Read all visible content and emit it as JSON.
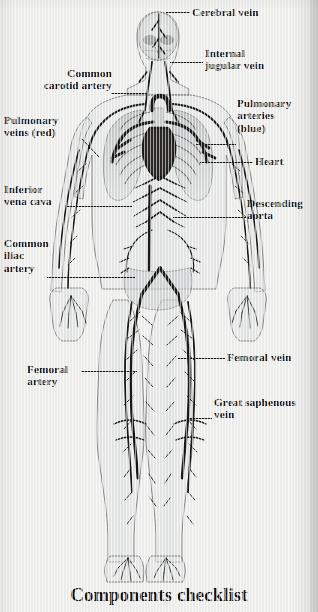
{
  "figure": {
    "caption": "Components checklist",
    "background_color": "#f1f1f0",
    "ink_color": "#1b1a18",
    "body_tint": "#b9bcbd"
  },
  "labels": [
    {
      "id": "cerebral-vein",
      "text": "Cerebral vein",
      "side": "right",
      "align": "left",
      "x": 192,
      "y": 6,
      "width": 120
    },
    {
      "id": "internal-jugular",
      "text": "Internal\njugular vein",
      "side": "right",
      "align": "left",
      "x": 205,
      "y": 47,
      "width": 110
    },
    {
      "id": "common-carotid",
      "text": "Common\ncarotid artery",
      "side": "left",
      "align": "right",
      "x": 8,
      "y": 67,
      "width": 104
    },
    {
      "id": "pulmonary-arteries",
      "text": "Pulmonary\narteries\n(blue)",
      "side": "right",
      "align": "left",
      "x": 237,
      "y": 97,
      "width": 80
    },
    {
      "id": "pulmonary-veins",
      "text": "Pulmonary\nveins (red)",
      "side": "left",
      "align": "left",
      "x": 4,
      "y": 114,
      "width": 100
    },
    {
      "id": "heart",
      "text": "Heart",
      "side": "right",
      "align": "left",
      "x": 255,
      "y": 155,
      "width": 60
    },
    {
      "id": "inferior-vena-cava",
      "text": "Inferior\nvena cava",
      "side": "left",
      "align": "left",
      "x": 4,
      "y": 183,
      "width": 96
    },
    {
      "id": "descending-aorta",
      "text": "Descending\naorta",
      "side": "right",
      "align": "left",
      "x": 247,
      "y": 197,
      "width": 70
    },
    {
      "id": "common-iliac",
      "text": "Common\niliac\nartery",
      "side": "left",
      "align": "left",
      "x": 4,
      "y": 237,
      "width": 80
    },
    {
      "id": "femoral-vein",
      "text": "Femoral vein",
      "side": "right",
      "align": "left",
      "x": 227,
      "y": 351,
      "width": 88
    },
    {
      "id": "femoral-artery",
      "text": "Femoral\nartery",
      "side": "left",
      "align": "left",
      "x": 27,
      "y": 363,
      "width": 80
    },
    {
      "id": "great-saphenous",
      "text": "Great saphenous\nvein",
      "side": "right",
      "align": "left",
      "x": 214,
      "y": 396,
      "width": 104
    }
  ],
  "leaders": [
    {
      "id": "cerebral-vein-leader",
      "x": 166,
      "y": 12,
      "length": 24
    },
    {
      "id": "internal-jugular-leader",
      "x": 170,
      "y": 62,
      "length": 33
    },
    {
      "id": "common-carotid-leader",
      "x": 111,
      "y": 93,
      "length": 36
    },
    {
      "id": "pulmonary-arteries-leader",
      "x": 196,
      "y": 144,
      "length": 40
    },
    {
      "id": "heart-leader",
      "x": 200,
      "y": 162,
      "length": 53
    },
    {
      "id": "inferior-vena-cava-leader",
      "x": 66,
      "y": 206,
      "length": 66
    },
    {
      "id": "descending-aorta-leader",
      "x": 173,
      "y": 217,
      "length": 73
    },
    {
      "id": "common-iliac-leader",
      "x": 47,
      "y": 277,
      "length": 88
    },
    {
      "id": "femoral-vein-leader",
      "x": 178,
      "y": 358,
      "length": 47
    },
    {
      "id": "femoral-artery-leader",
      "x": 81,
      "y": 371,
      "length": 56
    },
    {
      "id": "great-saphenous-leader",
      "x": 188,
      "y": 418,
      "length": 24
    }
  ],
  "leader_diagonals": [
    {
      "id": "pulmonary-veins-leader-diag",
      "x1": 81,
      "y1": 138,
      "x2": 98,
      "y2": 156
    }
  ]
}
